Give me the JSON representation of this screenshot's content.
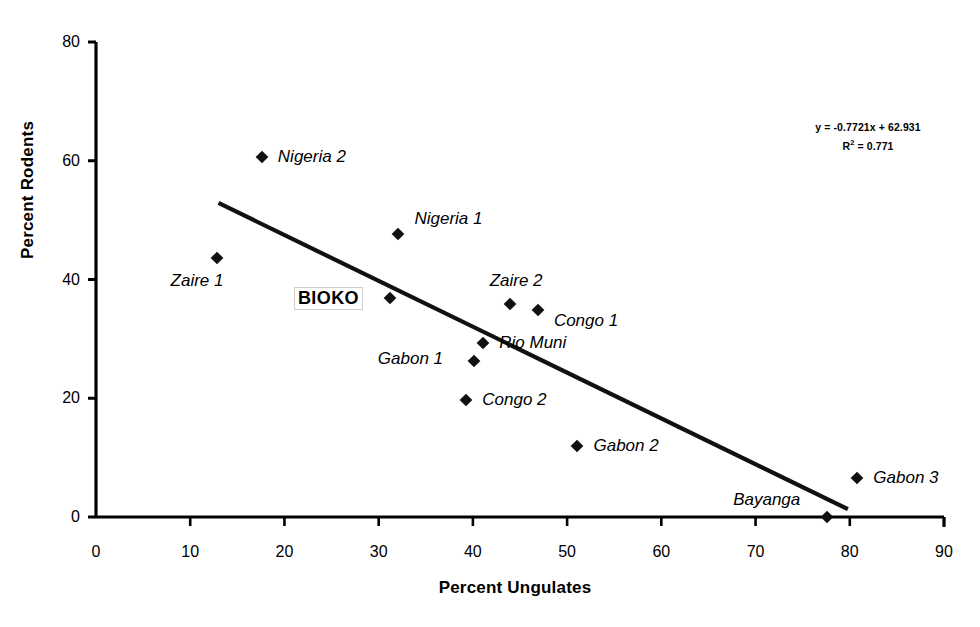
{
  "chart_data": {
    "type": "scatter",
    "title": "",
    "xlabel": "Percent Ungulates",
    "ylabel": "Percent Rodents",
    "xlim": [
      0,
      90
    ],
    "ylim": [
      0,
      80
    ],
    "xticks": [
      "0",
      "10",
      "20",
      "30",
      "40",
      "50",
      "60",
      "70",
      "80",
      "90"
    ],
    "yticks": [
      "0",
      "20",
      "40",
      "60",
      "80"
    ],
    "grid": false,
    "legend": "none",
    "annotations": {
      "equation": "y = -0.7721x + 62.931",
      "r_squared_label": "R",
      "r_squared_exp": "2",
      "r_squared_value": "= 0.771"
    },
    "trendline": {
      "slope": -0.7721,
      "intercept": 62.931,
      "r_squared": 0.771,
      "x_start": 13,
      "x_end": 79.8
    },
    "points": [
      {
        "name": "Nigeria 2",
        "x": 17.6,
        "y": 60.6,
        "label": "Nigeria 2",
        "label_pos": "right",
        "style": "italic"
      },
      {
        "name": "Nigeria 1",
        "x": 32.1,
        "y": 47.6,
        "label": "Nigeria 1",
        "label_pos": "right-up",
        "style": "italic"
      },
      {
        "name": "Zaire 1",
        "x": 12.8,
        "y": 43.6,
        "label": "Zaire 1",
        "label_pos": "below-left",
        "style": "italic"
      },
      {
        "name": "BIOKO",
        "x": 31.2,
        "y": 36.9,
        "label": "BIOKO",
        "label_pos": "left",
        "style": "bold-box"
      },
      {
        "name": "Zaire 2",
        "x": 43.9,
        "y": 35.9,
        "label": "Zaire 2",
        "label_pos": "above",
        "style": "italic"
      },
      {
        "name": "Congo 1",
        "x": 46.9,
        "y": 34.8,
        "label": "Congo 1",
        "label_pos": "right-down",
        "style": "italic"
      },
      {
        "name": "Rio Muni",
        "x": 41.1,
        "y": 29.3,
        "label": "Rio Muni",
        "label_pos": "right",
        "style": "italic"
      },
      {
        "name": "Gabon 1",
        "x": 40.1,
        "y": 26.3,
        "label": "Gabon 1",
        "label_pos": "left",
        "style": "italic"
      },
      {
        "name": "Congo 2",
        "x": 39.3,
        "y": 19.7,
        "label": "Congo 2",
        "label_pos": "right",
        "style": "italic"
      },
      {
        "name": "Gabon 2",
        "x": 51.1,
        "y": 12.0,
        "label": "Gabon 2",
        "label_pos": "right",
        "style": "italic"
      },
      {
        "name": "Gabon 3",
        "x": 80.8,
        "y": 6.6,
        "label": "Gabon 3",
        "label_pos": "right",
        "style": "italic"
      },
      {
        "name": "Bayanga",
        "x": 77.6,
        "y": 0.0,
        "label": "Bayanga",
        "label_pos": "above-left",
        "style": "italic"
      }
    ]
  },
  "axis": {
    "x_title": "Percent Ungulates",
    "y_title": "Percent Rodents"
  }
}
